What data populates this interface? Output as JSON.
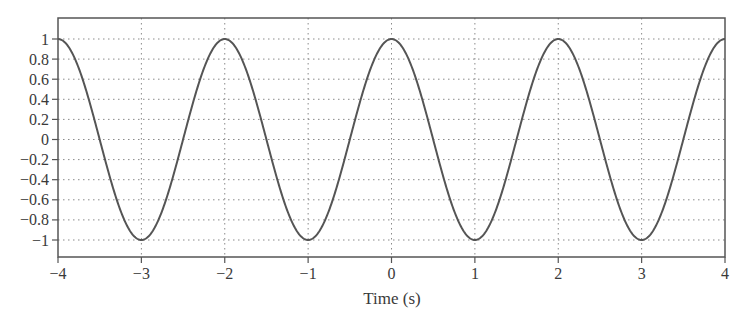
{
  "chart_data": {
    "type": "line",
    "title": "",
    "xlabel": "Time (s)",
    "ylabel": "",
    "xlim": [
      -4,
      4
    ],
    "ylim": [
      -1.2,
      1.2
    ],
    "grid": true,
    "grid_style": "dotted",
    "legend": null,
    "x_ticks": [
      -4,
      -3,
      -2,
      -1,
      0,
      1,
      2,
      3,
      4
    ],
    "x_tick_labels": [
      "−4",
      "−3",
      "−2",
      "−1",
      "0",
      "1",
      "2",
      "3",
      "4"
    ],
    "y_ticks": [
      1,
      0.8,
      0.6,
      0.4,
      0.2,
      0,
      -0.2,
      -0.4,
      -0.6,
      -0.8,
      -1
    ],
    "y_tick_labels": [
      "1",
      "0.8",
      "0.6",
      "0.4",
      "0.2",
      "0",
      "−0.2",
      "−0.4",
      "−0.6",
      "−0.8",
      "−1"
    ],
    "series": [
      {
        "name": "x(t) = cos(πt)",
        "function": "cos(pi*t)",
        "color": "#555555",
        "x": [
          -4,
          -3.5,
          -3,
          -2.5,
          -2,
          -1.5,
          -1,
          -0.5,
          0,
          0.5,
          1,
          1.5,
          2,
          2.5,
          3,
          3.5,
          4
        ],
        "values": [
          1,
          0,
          -1,
          0,
          1,
          0,
          -1,
          0,
          1,
          0,
          -1,
          0,
          1,
          0,
          -1,
          0,
          1
        ]
      }
    ],
    "colors": {
      "frame": "#555555",
      "grid": "#8a8a8a",
      "curve": "#555555",
      "text": "#3a3a3a"
    }
  }
}
